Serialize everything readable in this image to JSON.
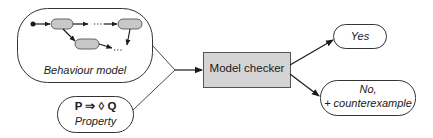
{
  "diagram": {
    "behaviour_model": {
      "label": "Behaviour model",
      "states": [
        "state-1",
        "state-2",
        "state-3"
      ],
      "ellipsis": "..."
    },
    "property": {
      "formula": "P ⇒ ◊ Q",
      "label": "Property"
    },
    "model_checker": {
      "label": "Model checker"
    },
    "outputs": {
      "yes": "Yes",
      "no_line1": "No,",
      "no_line2": "+ counterexample"
    },
    "colors": {
      "stroke": "#1a1a1a",
      "box_fill": "#d4d4d4",
      "state_fill": "#c8c8c8",
      "background": "#ffffff"
    }
  }
}
